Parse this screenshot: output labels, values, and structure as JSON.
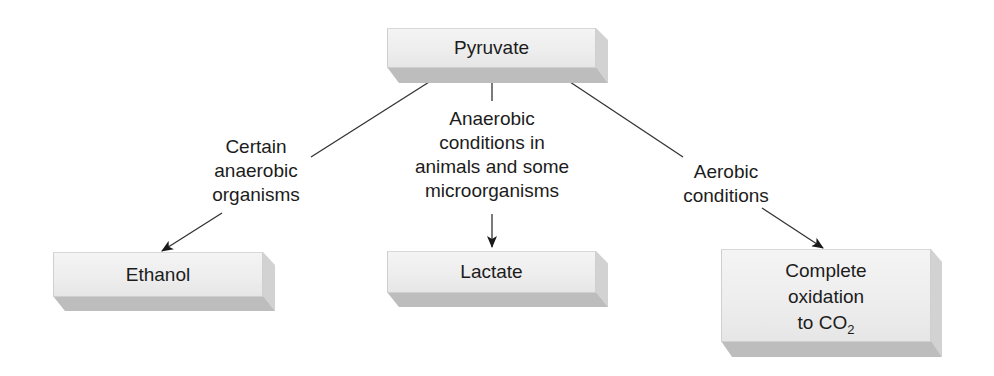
{
  "diagram": {
    "nodes": {
      "pyruvate": {
        "label": "Pyruvate"
      },
      "ethanol": {
        "label": "Ethanol"
      },
      "lactate": {
        "label": "Lactate"
      },
      "co2": {
        "line1": "Complete",
        "line2": "oxidation",
        "line3_prefix": "to CO",
        "line3_sub": "2"
      }
    },
    "edges": {
      "left": {
        "line1": "Certain",
        "line2": "anaerobic",
        "line3": "organisms",
        "from": "Pyruvate",
        "to": "Ethanol"
      },
      "middle": {
        "line1": "Anaerobic",
        "line2": "conditions in",
        "line3": "animals and some",
        "line4": "microorganisms",
        "from": "Pyruvate",
        "to": "Lactate"
      },
      "right": {
        "line1": "Aerobic",
        "line2": "conditions",
        "from": "Pyruvate",
        "to": "Complete oxidation to CO2"
      }
    },
    "colors": {
      "line": "#333333",
      "box_face": "#efefef",
      "box_bottom": "#bdbdbd",
      "box_side": "#d2d2d2"
    }
  }
}
